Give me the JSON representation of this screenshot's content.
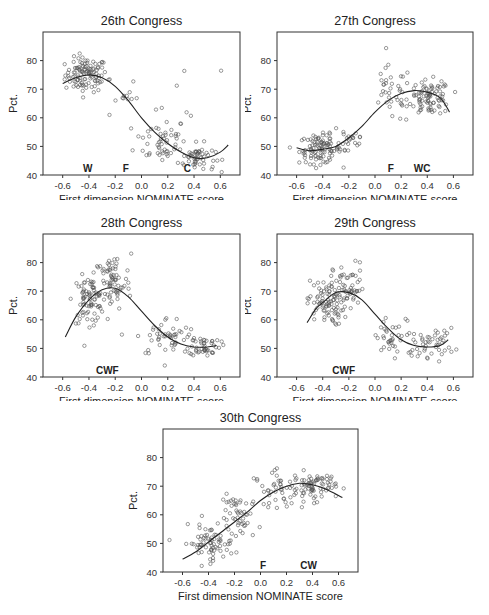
{
  "figure": {
    "xlabel": "First dimension NOMINATE score",
    "ylabel": "Pct.",
    "xticks": [
      "-0.6",
      "-0.4",
      "-0.2",
      "0.0",
      "0.2",
      "0.4",
      "0.6"
    ],
    "yticks": [
      "40",
      "50",
      "60",
      "70",
      "80"
    ]
  },
  "chart_data": [
    {
      "type": "scatter",
      "title": "26th Congress",
      "xlabel": "First dimension NOMINATE score",
      "ylabel": "Pct.",
      "xlim": [
        -0.75,
        0.75
      ],
      "ylim": [
        40,
        90
      ],
      "grid": false,
      "annotations": [
        {
          "text": "W",
          "x": -0.41
        },
        {
          "text": "F",
          "x": -0.12
        },
        {
          "text": "C",
          "x": 0.35
        }
      ],
      "fit_curve": {
        "x": [
          -0.6,
          -0.5,
          -0.4,
          -0.3,
          -0.2,
          -0.1,
          0.0,
          0.1,
          0.2,
          0.3,
          0.4,
          0.5,
          0.6,
          0.66
        ],
        "y": [
          72,
          74,
          75,
          74,
          71,
          66,
          60,
          55,
          51,
          48,
          46,
          46,
          48,
          50.5
        ]
      },
      "clusters": [
        {
          "cx": -0.42,
          "cy": 75,
          "sx": 0.08,
          "sy": 3,
          "n": 110
        },
        {
          "cx": -0.15,
          "cy": 68,
          "sx": 0.06,
          "sy": 5,
          "n": 12
        },
        {
          "cx": 0.15,
          "cy": 52,
          "sx": 0.1,
          "sy": 4,
          "n": 50
        },
        {
          "cx": 0.42,
          "cy": 46,
          "sx": 0.07,
          "sy": 2.5,
          "n": 60
        },
        {
          "cx": 0.3,
          "cy": 66,
          "sx": 0.15,
          "sy": 6,
          "n": 8
        }
      ]
    },
    {
      "type": "scatter",
      "title": "27th Congress",
      "xlabel": "First dimension NOMINATE score",
      "ylabel": "Pct.",
      "xlim": [
        -0.75,
        0.75
      ],
      "ylim": [
        40,
        90
      ],
      "grid": false,
      "annotations": [
        {
          "text": "F",
          "x": 0.12
        },
        {
          "text": "WC",
          "x": 0.36
        }
      ],
      "fit_curve": {
        "x": [
          -0.6,
          -0.5,
          -0.4,
          -0.3,
          -0.2,
          -0.1,
          0.0,
          0.1,
          0.2,
          0.3,
          0.4,
          0.5,
          0.57
        ],
        "y": [
          49.5,
          48.5,
          49,
          50,
          53,
          57,
          62,
          66,
          68.5,
          69.5,
          69,
          67,
          62
        ]
      },
      "clusters": [
        {
          "cx": -0.42,
          "cy": 49,
          "sx": 0.08,
          "sy": 2.5,
          "n": 100
        },
        {
          "cx": -0.2,
          "cy": 53,
          "sx": 0.07,
          "sy": 4,
          "n": 25
        },
        {
          "cx": 0.12,
          "cy": 68,
          "sx": 0.08,
          "sy": 5,
          "n": 35
        },
        {
          "cx": 0.42,
          "cy": 67,
          "sx": 0.08,
          "sy": 3,
          "n": 90
        }
      ]
    },
    {
      "type": "scatter",
      "title": "28th Congress",
      "xlabel": "First dimension NOMINATE score",
      "ylabel": "Pct.",
      "xlim": [
        -0.75,
        0.75
      ],
      "ylim": [
        40,
        90
      ],
      "grid": false,
      "annotations": [
        {
          "text": "CWF",
          "x": -0.26
        }
      ],
      "fit_curve": {
        "x": [
          -0.58,
          -0.5,
          -0.4,
          -0.3,
          -0.2,
          -0.1,
          0.0,
          0.1,
          0.2,
          0.3,
          0.4,
          0.5,
          0.57
        ],
        "y": [
          54,
          61,
          67,
          70.5,
          71,
          68,
          63,
          58,
          54,
          51.5,
          50.5,
          50.5,
          51
        ]
      },
      "clusters": [
        {
          "cx": -0.4,
          "cy": 67,
          "sx": 0.06,
          "sy": 4,
          "n": 80
        },
        {
          "cx": -0.22,
          "cy": 73,
          "sx": 0.07,
          "sy": 5,
          "n": 70
        },
        {
          "cx": 0.2,
          "cy": 54,
          "sx": 0.12,
          "sy": 3.5,
          "n": 50
        },
        {
          "cx": 0.48,
          "cy": 51,
          "sx": 0.06,
          "sy": 1.8,
          "n": 45
        }
      ]
    },
    {
      "type": "scatter",
      "title": "29th Congress",
      "xlabel": "First dimension NOMINATE score",
      "ylabel": "Pct.",
      "xlim": [
        -0.75,
        0.75
      ],
      "ylim": [
        40,
        90
      ],
      "grid": false,
      "annotations": [
        {
          "text": "CWF",
          "x": -0.24
        }
      ],
      "fit_curve": {
        "x": [
          -0.52,
          -0.45,
          -0.4,
          -0.3,
          -0.2,
          -0.1,
          0.0,
          0.1,
          0.2,
          0.3,
          0.4,
          0.5,
          0.56
        ],
        "y": [
          59,
          64,
          66,
          69.5,
          69.5,
          67,
          62,
          57,
          53,
          51,
          50.5,
          51,
          53
        ]
      },
      "clusters": [
        {
          "cx": -0.38,
          "cy": 66,
          "sx": 0.07,
          "sy": 4,
          "n": 90
        },
        {
          "cx": -0.2,
          "cy": 71,
          "sx": 0.06,
          "sy": 4.5,
          "n": 50
        },
        {
          "cx": 0.15,
          "cy": 53,
          "sx": 0.1,
          "sy": 4,
          "n": 40
        },
        {
          "cx": 0.45,
          "cy": 52,
          "sx": 0.08,
          "sy": 2.5,
          "n": 45
        }
      ]
    },
    {
      "type": "scatter",
      "title": "30th Congress",
      "xlabel": "First dimension NOMINATE score",
      "ylabel": "Pct.",
      "xlim": [
        -0.75,
        0.75
      ],
      "ylim": [
        40,
        90
      ],
      "grid": false,
      "annotations": [
        {
          "text": "F",
          "x": 0.02
        },
        {
          "text": "CW",
          "x": 0.37
        }
      ],
      "fit_curve": {
        "x": [
          -0.6,
          -0.5,
          -0.4,
          -0.3,
          -0.2,
          -0.1,
          0.0,
          0.1,
          0.2,
          0.3,
          0.4,
          0.5,
          0.63
        ],
        "y": [
          44.5,
          47,
          50.5,
          54,
          57.5,
          61,
          65,
          68,
          70,
          71,
          70.5,
          69,
          66
        ]
      },
      "clusters": [
        {
          "cx": -0.4,
          "cy": 50,
          "sx": 0.1,
          "sy": 3,
          "n": 70
        },
        {
          "cx": -0.15,
          "cy": 59,
          "sx": 0.08,
          "sy": 4,
          "n": 50
        },
        {
          "cx": 0.15,
          "cy": 69,
          "sx": 0.1,
          "sy": 3,
          "n": 50
        },
        {
          "cx": 0.42,
          "cy": 70,
          "sx": 0.08,
          "sy": 2.5,
          "n": 70
        }
      ]
    }
  ],
  "colors": {
    "axis": "#333333",
    "marker": "#555555",
    "curve": "#222222",
    "background": "#ffffff"
  }
}
